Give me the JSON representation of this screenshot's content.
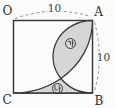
{
  "diagram": {
    "type": "geometry-figure",
    "square": {
      "corners": {
        "top_left": "O",
        "top_right": "A",
        "bottom_right": "B",
        "bottom_left": "C"
      },
      "side_length": "10"
    },
    "dimensions": {
      "top": "10",
      "right": "10"
    },
    "curves": [
      "quarter-circle centered at O, radius 10, from A to C",
      "semicircle on diameter AB bulging into the square"
    ],
    "regions": [
      {
        "label": "㉮",
        "description": "shaded lens between semicircle and quarter arc, from A to crossing point"
      },
      {
        "label": "㉯",
        "description": "shaded region between arcs and bottom edge CB"
      }
    ],
    "colors": {
      "line": "#3b3b3b",
      "dash": "#909090",
      "shade": "#d6d6d6",
      "background": "#fbfbfb",
      "text": "#2e2e2e"
    }
  }
}
